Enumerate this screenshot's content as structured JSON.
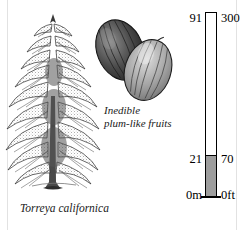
{
  "plate": {
    "subject_caption": "Torreya californica",
    "fruit_caption_line1": "Inedible",
    "fruit_caption_line2": "plum-like fruits",
    "ink_color": "#1a1a1a",
    "fill_color": "#9d9d9d"
  },
  "scale": {
    "top_metric": "91",
    "top_imperial": "300",
    "mid_metric": "21",
    "mid_imperial": "70",
    "base_metric": "0m",
    "base_imperial": "0ft"
  },
  "chart_data": {
    "type": "bar",
    "orientation": "vertical",
    "categories": [
      "Torreya californica"
    ],
    "values": [
      21
    ],
    "ylabel": "Height",
    "ylim": [
      0,
      91
    ],
    "units_left": "m",
    "units_right": "ft",
    "tick_values_metric": [
      0,
      21,
      91
    ],
    "tick_values_imperial": [
      0,
      70,
      300
    ],
    "tick_labels_metric": [
      "0m",
      "21",
      "91"
    ],
    "tick_labels_imperial": [
      "0ft",
      "70",
      "300"
    ],
    "filled_fraction": 0.2308,
    "grid": false,
    "legend": "none"
  }
}
